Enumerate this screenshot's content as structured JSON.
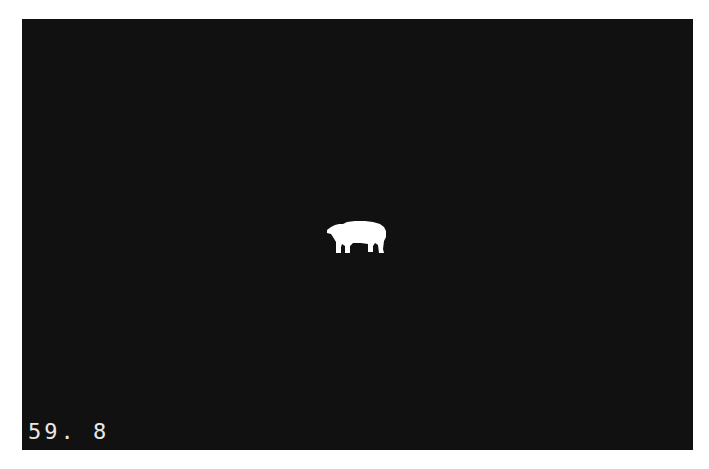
{
  "game": {
    "background_color": "#111111",
    "sprite": {
      "name": "polar-bear",
      "color": "#ffffff"
    },
    "hud": {
      "value": "59. 8"
    }
  }
}
